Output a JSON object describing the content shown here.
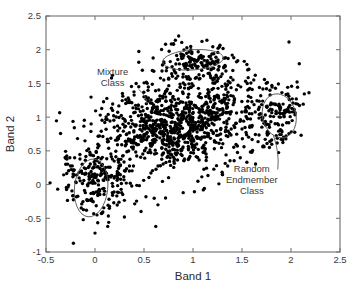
{
  "chart_data": {
    "type": "scatter",
    "title": "",
    "xlabel": "Band 1",
    "ylabel": "Band 2",
    "xlim": [
      -0.5,
      2.5
    ],
    "ylim": [
      -1,
      2.5
    ],
    "xticks": [
      -0.5,
      0,
      0.5,
      1,
      1.5,
      2,
      2.5
    ],
    "xticklabels": [
      "-0.5",
      "0",
      "0.5",
      "1",
      "1.5",
      "2",
      "2.5"
    ],
    "yticks": [
      -1,
      -0.5,
      0,
      0.5,
      1,
      1.5,
      2,
      2.5
    ],
    "yticklabels": [
      "-1",
      "-0.5",
      "0",
      "0.5",
      "1",
      "1.5",
      "2",
      "2.5"
    ],
    "grid": false,
    "legend": "none",
    "marker": "filled-circle",
    "marker_color": "#000000",
    "marker_size_px": 1.7,
    "n_points": 1500,
    "series": [
      {
        "name": "main-mixture-cloud",
        "kind": "gaussian-cloud",
        "n": 1020,
        "center": [
          0.88,
          0.93
        ],
        "sigma": [
          0.44,
          0.34
        ],
        "rotation_deg": 32,
        "description": "dense elongated diagonal cloud spanning roughly x 0.0-1.8, y 0.0-2.0"
      },
      {
        "name": "left-endmember-cloud",
        "kind": "gaussian-cloud",
        "n": 210,
        "center": [
          0.02,
          0.08
        ],
        "sigma": [
          0.17,
          0.27
        ],
        "rotation_deg": 10,
        "description": "lower-left vertical cluster inside left ellipse"
      },
      {
        "name": "top-endmember-cloud",
        "kind": "gaussian-cloud",
        "n": 130,
        "center": [
          1.02,
          1.82
        ],
        "sigma": [
          0.21,
          0.13
        ],
        "rotation_deg": 0,
        "description": "upper cluster inside flat top ellipse"
      },
      {
        "name": "right-endmember-cloud",
        "kind": "gaussian-cloud",
        "n": 110,
        "center": [
          1.87,
          1.02
        ],
        "sigma": [
          0.12,
          0.22
        ],
        "rotation_deg": -12,
        "description": "right vertical cluster inside right ellipse"
      },
      {
        "name": "sparse-outliers",
        "kind": "scattered",
        "n": 30,
        "points": [
          [
            -0.22,
            -0.87
          ],
          [
            0.0,
            -0.72
          ],
          [
            0.13,
            -0.62
          ],
          [
            0.62,
            -0.62
          ],
          [
            0.3,
            -0.48
          ],
          [
            0.47,
            -0.4
          ],
          [
            -0.12,
            -0.52
          ],
          [
            0.02,
            -0.45
          ],
          [
            0.72,
            -0.2
          ],
          [
            0.9,
            -0.12
          ],
          [
            1.05,
            0.05
          ],
          [
            1.3,
            0.15
          ],
          [
            1.55,
            0.33
          ],
          [
            0.28,
            1.35
          ],
          [
            0.18,
            1.1
          ],
          [
            0.1,
            0.92
          ],
          [
            0.42,
            1.5
          ],
          [
            0.6,
            1.68
          ],
          [
            0.72,
            2.08
          ],
          [
            0.82,
            2.14
          ],
          [
            1.4,
            1.92
          ],
          [
            1.55,
            1.78
          ],
          [
            1.62,
            1.55
          ],
          [
            1.75,
            1.42
          ],
          [
            2.05,
            1.2
          ],
          [
            1.95,
            0.72
          ],
          [
            1.78,
            0.55
          ],
          [
            1.6,
            0.48
          ],
          [
            0.36,
            0.02
          ],
          [
            0.52,
            -0.18
          ]
        ]
      }
    ],
    "ellipses": [
      {
        "name": "left-endmember-ellipse",
        "center": [
          -0.04,
          -0.05
        ],
        "rx": 0.17,
        "ry": 0.43,
        "rotation_deg": 6
      },
      {
        "name": "top-endmember-ellipse",
        "center": [
          1.0,
          1.85
        ],
        "rx": 0.31,
        "ry": 0.15,
        "rotation_deg": -4
      },
      {
        "name": "right-endmember-ellipse",
        "center": [
          1.88,
          1.02
        ],
        "rx": 0.17,
        "ry": 0.33,
        "rotation_deg": -14
      }
    ],
    "annotations": [
      {
        "name": "mixture-class-annotation",
        "lines": [
          "Mixture",
          "Class"
        ],
        "text_anchor_data": [
          0.18,
          1.62
        ],
        "target_data": [
          0.53,
          1.2
        ]
      },
      {
        "name": "random-endmember-class-annotation",
        "lines": [
          "Random",
          "Endmember",
          "Class"
        ],
        "text_anchor_data": [
          1.6,
          0.18
        ],
        "target_data": [
          1.82,
          0.73
        ]
      }
    ]
  }
}
